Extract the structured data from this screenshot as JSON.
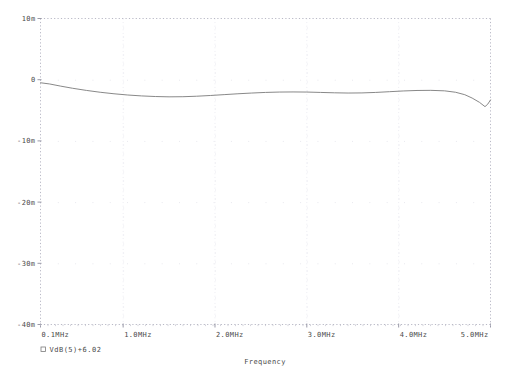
{
  "chart_data": {
    "type": "line",
    "title": "",
    "xlabel": "Frequency",
    "ylabel": "",
    "grid": true,
    "legend_position": "below-axis-left",
    "x_unit": "MHz",
    "y_unit": "dB",
    "xlim": [
      0.1,
      5.0
    ],
    "ylim": [
      -0.04,
      0.01
    ],
    "xticks": [
      0.1,
      1.0,
      2.0,
      3.0,
      4.0,
      5.0
    ],
    "xticklabels": [
      "0.1MHz",
      "1.0MHz",
      "2.0MHz",
      "3.0MHz",
      "4.0MHz",
      "5.0MHz"
    ],
    "yticks": [
      0.01,
      0.0,
      -0.01,
      -0.02,
      -0.03,
      -0.04
    ],
    "yticklabels": [
      "10m",
      "0",
      "-10m",
      "-20m",
      "-30m",
      "-40m"
    ],
    "series": [
      {
        "name": "VdB(5)+6.02",
        "marker": "square",
        "color": "#7a7a7a",
        "x": [
          0.1,
          0.2,
          0.32,
          0.45,
          0.6,
          0.75,
          0.9,
          1.05,
          1.2,
          1.35,
          1.5,
          1.65,
          1.8,
          1.95,
          2.1,
          2.25,
          2.4,
          2.55,
          2.7,
          2.85,
          3.0,
          3.15,
          3.3,
          3.45,
          3.6,
          3.75,
          3.9,
          4.05,
          4.2,
          4.35,
          4.5,
          4.62,
          4.72,
          4.8,
          4.88,
          4.94,
          4.97,
          5.0
        ],
        "y": [
          -0.0005,
          -0.0007,
          -0.00105,
          -0.0014,
          -0.00175,
          -0.00205,
          -0.0023,
          -0.0025,
          -0.00265,
          -0.00275,
          -0.0028,
          -0.00278,
          -0.0027,
          -0.00258,
          -0.00244,
          -0.0023,
          -0.00218,
          -0.00208,
          -0.00202,
          -0.002,
          -0.00202,
          -0.00208,
          -0.00214,
          -0.00218,
          -0.00216,
          -0.00208,
          -0.00196,
          -0.00184,
          -0.00176,
          -0.00174,
          -0.00182,
          -0.00205,
          -0.00245,
          -0.003,
          -0.0037,
          -0.0044,
          -0.004,
          -0.0033
        ]
      }
    ]
  },
  "legend": {
    "marker_symbol": "square-outline",
    "entries": [
      {
        "label": "VdB(5)+6.02"
      }
    ]
  },
  "axes": {
    "x_title": "Frequency",
    "y_title": ""
  }
}
